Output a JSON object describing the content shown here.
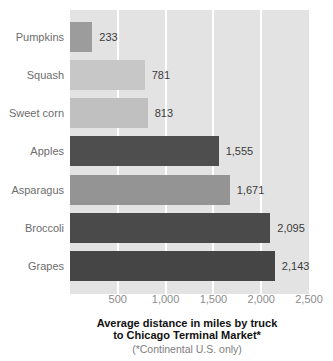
{
  "chart_data": {
    "type": "bar",
    "orientation": "horizontal",
    "title": "Average distance in miles by truck to Chicago Terminal Market*",
    "title_line1": "Average distance in miles by truck",
    "title_line2": "to Chicago Terminal Market*",
    "subtitle": "(*Continental U.S. only)",
    "categories": [
      "Pumpkins",
      "Squash",
      "Sweet corn",
      "Apples",
      "Asparagus",
      "Broccoli",
      "Grapes"
    ],
    "values": [
      233,
      781,
      813,
      1555,
      1671,
      2095,
      2143
    ],
    "xlim": [
      0,
      2500
    ],
    "x_ticks": [
      "500",
      "1,000",
      "1,500",
      "2,000",
      "2,500"
    ],
    "grid": true,
    "legend": "none",
    "bars": [
      {
        "label": "Pumpkins",
        "value": 233,
        "display": "233",
        "pct": 9.32,
        "color": "#9c9c9c"
      },
      {
        "label": "Squash",
        "value": 781,
        "display": "781",
        "pct": 31.24,
        "color": "#c7c7c7"
      },
      {
        "label": "Sweet corn",
        "value": 813,
        "display": "813",
        "pct": 32.52,
        "color": "#c0c0c0"
      },
      {
        "label": "Apples",
        "value": 1555,
        "display": "1,555",
        "pct": 62.2,
        "color": "#4e4e4e"
      },
      {
        "label": "Asparagus",
        "value": 1671,
        "display": "1,671",
        "pct": 66.84,
        "color": "#949494"
      },
      {
        "label": "Broccoli",
        "value": 2095,
        "display": "2,095",
        "pct": 83.8,
        "color": "#4a4a4a"
      },
      {
        "label": "Grapes",
        "value": 2143,
        "display": "2,143",
        "pct": 85.72,
        "color": "#454545"
      }
    ],
    "colors": {
      "page_background": "#ffffff",
      "plot_background": "#e3e3e3",
      "gridline": "#ffffff",
      "category_label": "#6d6d6d",
      "value_label": "#3c3c3c",
      "tick_label": "#8c8c8c",
      "title": "#111111",
      "subtitle": "#7e7e7e"
    }
  }
}
